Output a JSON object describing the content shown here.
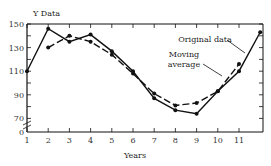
{
  "chart_data": {
    "type": "line",
    "title": "",
    "xlabel": "Years",
    "ylabel": "Y Data",
    "x": [
      1,
      2,
      3,
      4,
      5,
      6,
      7,
      8,
      9,
      10,
      11,
      12
    ],
    "xticks": [
      "1",
      "2",
      "3",
      "4",
      "5",
      "6",
      "7",
      "8",
      "9",
      "10",
      "11"
    ],
    "yticks": [
      "0",
      "70",
      "90",
      "110",
      "130",
      "150"
    ],
    "ylim": [
      0,
      155
    ],
    "axis_break": "between 0 and 70",
    "grid": false,
    "series": [
      {
        "name": "Original data",
        "style": "solid",
        "values": [
          110,
          146,
          135,
          141,
          127,
          110,
          87,
          77,
          74,
          93,
          110,
          143
        ]
      },
      {
        "name": "Moving average",
        "style": "dashed",
        "values": [
          null,
          130,
          140,
          135,
          124,
          108,
          91,
          81,
          83,
          93,
          116,
          null
        ]
      }
    ],
    "annotations": [
      "Original data",
      "Moving average"
    ]
  }
}
